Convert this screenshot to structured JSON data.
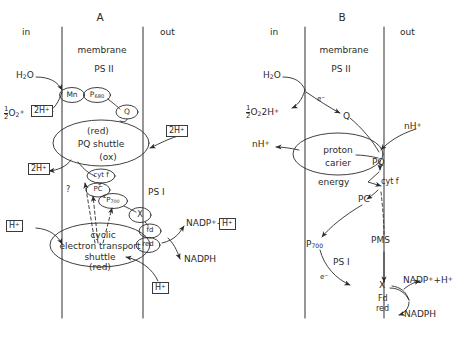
{
  "figure": {
    "type": "diagram",
    "panels": [
      "A",
      "B"
    ]
  },
  "panelA": {
    "label": "A",
    "compartments": {
      "in": "in",
      "membrane": "membrane",
      "out": "out"
    },
    "photosystem2": "PS II",
    "photosystem1": "PS I",
    "nodes": {
      "mn": "Mn",
      "p680_base": "P",
      "p680_sub": "680",
      "q": "Q",
      "cytf": "cyt f",
      "pc": "PC",
      "p700_base": "P",
      "p700_sub": "700",
      "x": "X",
      "fd": "fd",
      "red": "red"
    },
    "pq_shuttle": {
      "top": "(red)",
      "name": "PQ shuttle",
      "bottom": "(ox)"
    },
    "cyclic_shuttle": {
      "l1": "cyclic",
      "l2": "electron transport",
      "l3": "shuttle",
      "l4": "(red)"
    },
    "substrates": {
      "water": "H",
      "water_sub": "2",
      "water_tail": "O",
      "oxygen_half_num": "1",
      "oxygen_half_den": "2",
      "oxygen_base": "O",
      "oxygen_sub": "2",
      "nadp": "NADP",
      "nadp_sup": "+",
      "nadph": "NADPH",
      "question": "?"
    },
    "protons": {
      "box_2h_left_out": "2H",
      "box_2h_right_in": "2H",
      "box_2h_left_lower": "2H",
      "box_h_left": "H",
      "box_h_bottom": "H",
      "box_h_nadp": "H",
      "plus": "+"
    }
  },
  "panelB": {
    "label": "B",
    "compartments": {
      "in": "in",
      "membrane": "membrane",
      "out": "out"
    },
    "photosystem2": "PS II",
    "photosystem1": "PS I",
    "proton_carrier": {
      "l1": "proton",
      "l2": "carier"
    },
    "energy_label": "energy",
    "nodes": {
      "q": "Q",
      "pq": "PQ",
      "cytf": "cyt f",
      "pc": "PC",
      "pms": "PMS",
      "p700_base": "P",
      "p700_sub": "700",
      "x": "X",
      "fd": "Fd",
      "red": "red"
    },
    "substrates": {
      "water": "H",
      "water_sub": "2",
      "water_tail": "O",
      "oxygen_half_num": "1",
      "oxygen_half_den": "2",
      "oxygen_base": "O",
      "oxygen_sub": "2",
      "oxygen_protons": "2H",
      "nadp_h": "NADP",
      "nadp_sup": "+",
      "nadp_tail": "+H",
      "nadph": "NADPH"
    },
    "protons": {
      "nh_left": "nH",
      "nh_right": "nH",
      "plus": "+"
    },
    "electrons": {
      "e1": "e",
      "e2": "e",
      "minus": "−"
    }
  },
  "style": {
    "ink": "#2b2b2b",
    "membrane_line": "#4a4a4a",
    "background": "#ffffff"
  }
}
